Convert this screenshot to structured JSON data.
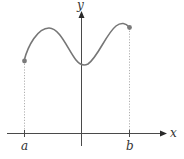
{
  "diagram": {
    "type": "function-graph",
    "axes": {
      "x_label": "x",
      "y_label": "y"
    },
    "ticks": {
      "a_label": "a",
      "b_label": "b"
    },
    "endpoints": [
      {
        "name": "left",
        "at": "a",
        "filled": true
      },
      {
        "name": "right",
        "at": "b",
        "filled": true
      }
    ],
    "features": [
      "local max (left)",
      "local min near y-axis",
      "local max (right)"
    ],
    "colors": {
      "axis": "#4a4a4a",
      "curve": "#767676",
      "guide": "#9a9a9a"
    }
  }
}
